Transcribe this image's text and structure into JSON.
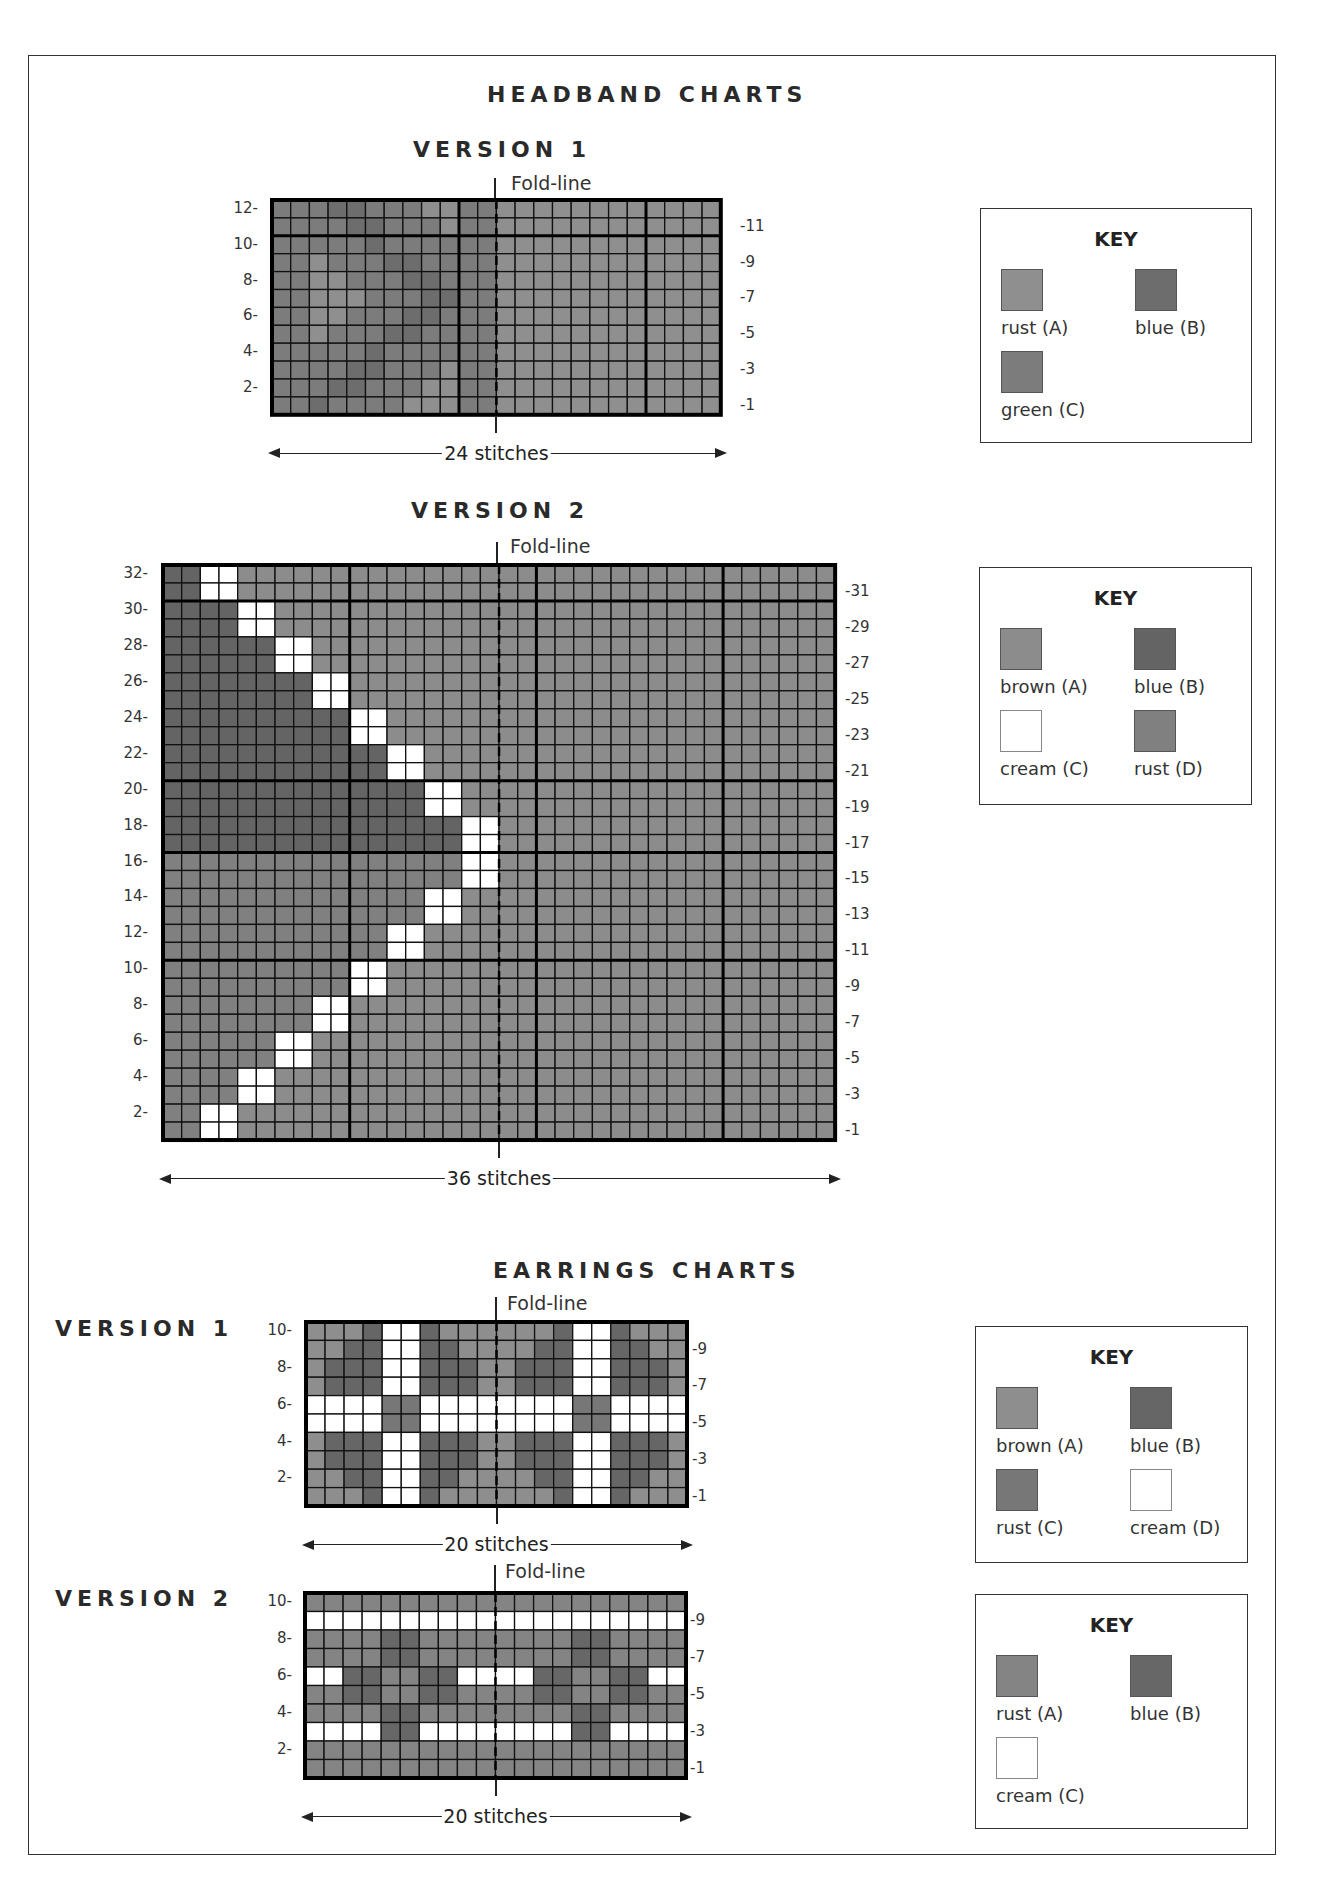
{
  "colors": {
    "hb1": {
      "A": "#8f8f8f",
      "B": "#6d6d6d",
      "C": "#7c7c7c"
    },
    "hb2": {
      "A": "#8c8c8c",
      "B": "#646464",
      "C": "#ffffff",
      "D": "#808080"
    },
    "er1": {
      "A": "#8e8e8e",
      "B": "#666666",
      "C": "#777777",
      "D": "#ffffff"
    },
    "er2": {
      "A": "#848484",
      "B": "#676767",
      "C": "#ffffff"
    }
  },
  "headband": {
    "title": "HEADBAND CHARTS",
    "v1": {
      "title": "VERSION 1",
      "fold_label": "Fold-line",
      "stitches_label": "24 stitches",
      "cols": 24,
      "rows": 12,
      "left_labels": [
        "12-",
        "10-",
        "8-",
        "6-",
        "4-",
        "2-"
      ],
      "right_labels": [
        "-11",
        "-9",
        "-7",
        "-5",
        "-3",
        "-1"
      ],
      "grid": [
        "CCCBBCCCAACCAAAAAAAAAAAA",
        "CCCCBBCCCACCAAAAAAAAAAAA",
        "CCCCCBCCCCCCAAAAAAAAAAAA",
        "CCACCCBBCCCCAAAAAAAAAAAA",
        "CCAACCCBBCCCAAAAAAAAAAAA",
        "CCAAACCCBBCCAAAAAAAAAAAA",
        "CCAACCCBBCCCAAAAAAAAAAAA",
        "CCACCCBBCCCCAAAAAAAAAAAA",
        "CCCCCBCCCCCCAAAAAAAAAAAA",
        "CCCCBBCCCACCAAAAAAAAAAAA",
        "CCCBBCCCAACCAAAAAAAAAAAA",
        "CCBCCCCAAACCAAAAAAAAAAAA"
      ],
      "key": {
        "title": "KEY",
        "items": [
          {
            "label": "rust (A)",
            "code": "A"
          },
          {
            "label": "blue (B)",
            "code": "B"
          },
          {
            "label": "green (C)",
            "code": "C"
          }
        ]
      }
    },
    "v2": {
      "title": "VERSION 2",
      "fold_label": "Fold-line",
      "stitches_label": "36 stitches",
      "cols": 36,
      "rows": 32,
      "left_labels": [
        "32-",
        "30-",
        "28-",
        "26-",
        "24-",
        "22-",
        "20-",
        "18-",
        "16-",
        "14-",
        "12-",
        "10-",
        "8-",
        "6-",
        "4-",
        "2-"
      ],
      "right_labels": [
        "-31",
        "-29",
        "-27",
        "-25",
        "-23",
        "-21",
        "-19",
        "-17",
        "-15",
        "-13",
        "-11",
        "-9",
        "-7",
        "-5",
        "-3",
        "-1"
      ],
      "diagonal_cream_start_col": [
        3,
        3,
        5,
        5,
        7,
        7,
        9,
        9,
        11,
        11,
        13,
        13,
        15,
        15,
        17,
        17,
        17,
        17,
        15,
        15,
        13,
        13,
        11,
        11,
        9,
        9,
        7,
        7,
        5,
        5,
        3,
        3
      ],
      "key": {
        "title": "KEY",
        "items": [
          {
            "label": "brown (A)",
            "code": "A"
          },
          {
            "label": "blue (B)",
            "code": "B"
          },
          {
            "label": "cream (C)",
            "code": "C"
          },
          {
            "label": "rust (D)",
            "code": "D"
          }
        ]
      }
    }
  },
  "earrings": {
    "title": "EARRINGS CHARTS",
    "v1": {
      "title": "VERSION 1",
      "fold_label": "Fold-line",
      "stitches_label": "20 stitches",
      "cols": 20,
      "rows": 10,
      "left_labels": [
        "10-",
        "8-",
        "6-",
        "4-",
        "2-"
      ],
      "right_labels": [
        "-9",
        "-7",
        "-5",
        "-3",
        "-1"
      ],
      "grid": [
        "AAABDDBAAAAAABDDBAAA",
        "AABBDDBBAAAABBDDBBAA",
        "ABBBDDBBBAABBBDDBBBA",
        "ABBBDDBBBAABBBDDBBBA",
        "DDDDCCDDDDDDDDCCDDDD",
        "DDDDCCDDDDDDDDCCDDDD",
        "ABBBDDBBBAABBBDDBBBA",
        "ABBBDDBBBAABBBDDBBBA",
        "AABBDDBBAAAABBDDBBAA",
        "AAABDDBAAAAAABDDBAAA"
      ],
      "key": {
        "title": "KEY",
        "items": [
          {
            "label": "brown (A)",
            "code": "A"
          },
          {
            "label": "blue (B)",
            "code": "B"
          },
          {
            "label": "rust (C)",
            "code": "C"
          },
          {
            "label": "cream (D)",
            "code": "D"
          }
        ]
      }
    },
    "v2": {
      "title": "VERSION 2",
      "fold_label": "Fold-line",
      "stitches_label": "20 stitches",
      "cols": 20,
      "rows": 10,
      "left_labels": [
        "10-",
        "8-",
        "6-",
        "4-",
        "2-"
      ],
      "right_labels": [
        "-9",
        "-7",
        "-5",
        "-3",
        "-1"
      ],
      "grid": [
        "AAAAAAAAAAAAAAAAAAAA",
        "CCCCCCCCCCCCCCCCCCCC",
        "AAAABBAAAAAAAABBAAAA",
        "AAAABBAAAAAAAABBAAAA",
        "CCBBAABBCCCCBBAABBCC",
        "AABBAABBAAAABBAABBAA",
        "AAAABBAAAAAAAABBAAAA",
        "CCCCBBCCCCCCCCBBCCCC",
        "AAAAAAAAAAAAAAAAAAAA",
        "AAAAAAAAAAAAAAAAAAAA"
      ],
      "key": {
        "title": "KEY",
        "items": [
          {
            "label": "rust (A)",
            "code": "A"
          },
          {
            "label": "blue (B)",
            "code": "B"
          },
          {
            "label": "cream (C)",
            "code": "C"
          }
        ]
      }
    }
  }
}
